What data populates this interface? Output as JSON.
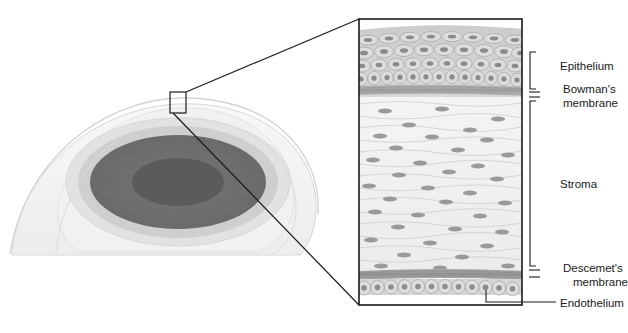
{
  "figure": {
    "type": "anatomical-diagram"
  },
  "labels": {
    "epithelium": "Epithelium",
    "bowmans_line1": "Bowman's",
    "bowmans_line2": "membrane",
    "stroma": "Stroma",
    "descemets_line1": "Descemet's",
    "descemets_line2": "membrane",
    "endothelium": "Endothelium"
  },
  "eye": {
    "name": "eye-illustration",
    "sclera_color": "#f2f2f2",
    "limbus_color": "#cfcfcf",
    "iris_color": "#6e6e6e",
    "pupil_color": "#595959",
    "outline_color": "#d0d0d0",
    "callout_box_color": "#1a1a1a"
  },
  "magnified": {
    "name": "cornea-cross-section",
    "border_color": "#1a1a1a",
    "epithelium_color": "#c9c9c9",
    "epithelium_cell_fill": "#dcdcdc",
    "epithelium_nucleus_color": "#8a8a8a",
    "bowmans_color": "#a8a8a8",
    "stroma_color": "#efefef",
    "stroma_lamella_color": "#c4c4c4",
    "keratocyte_color": "#9a9a9a",
    "descemets_color": "#9d9d9d",
    "endothelium_color": "#d2d2d2",
    "endothelium_nucleus_color": "#8d8d8d"
  },
  "layer_order": [
    "Epithelium",
    "Bowman's membrane",
    "Stroma",
    "Descemet's membrane",
    "Endothelium"
  ]
}
